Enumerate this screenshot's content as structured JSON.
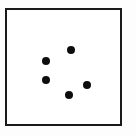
{
  "figure": {
    "type": "dot-pattern",
    "frame": {
      "color": "#1a1a1a",
      "background": "#ffffff"
    },
    "dot_color": "#0d0d0d",
    "dot_count": 5,
    "dots": [
      {
        "id": "dot-1",
        "x": 71,
        "y": 50
      },
      {
        "id": "dot-2",
        "x": 46,
        "y": 61
      },
      {
        "id": "dot-3",
        "x": 46,
        "y": 80
      },
      {
        "id": "dot-4",
        "x": 87,
        "y": 85
      },
      {
        "id": "dot-5",
        "x": 69,
        "y": 95
      }
    ]
  }
}
